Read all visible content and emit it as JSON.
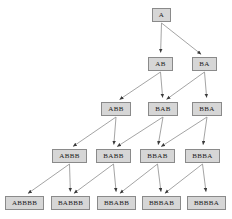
{
  "figure": {
    "type": "directed-graph",
    "title": "",
    "background_color": "#ffffff",
    "node_fill_color": "#d6d6d6",
    "node_border_color": "#8a8a8a",
    "node_text_color": "#1a1a1a",
    "edge_color": "#9a9a9a",
    "arrowhead_color": "#3a3a3a"
  },
  "levels": [
    {
      "index": 0,
      "nodes": [
        "A"
      ]
    },
    {
      "index": 1,
      "nodes": [
        "AB",
        "BA"
      ]
    },
    {
      "index": 2,
      "nodes": [
        "ABB",
        "BAB",
        "BBA"
      ]
    },
    {
      "index": 3,
      "nodes": [
        "ABBB",
        "BABB",
        "BBAB",
        "BBBA"
      ]
    },
    {
      "index": 4,
      "nodes": [
        "ABBBB",
        "BABBB",
        "BBABB",
        "BBBAB",
        "BBBBA"
      ]
    }
  ],
  "nodes": [
    {
      "id": "n0_0",
      "label": "A",
      "x": 152,
      "y": 8,
      "w": 19,
      "h": 14
    },
    {
      "id": "n1_0",
      "label": "AB",
      "x": 148,
      "y": 57,
      "w": 25,
      "h": 14
    },
    {
      "id": "n1_1",
      "label": "BA",
      "x": 192,
      "y": 57,
      "w": 25,
      "h": 14
    },
    {
      "id": "n2_0",
      "label": "ABB",
      "x": 101,
      "y": 102,
      "w": 30,
      "h": 14
    },
    {
      "id": "n2_1",
      "label": "BAB",
      "x": 148,
      "y": 102,
      "w": 30,
      "h": 14
    },
    {
      "id": "n2_2",
      "label": "BBA",
      "x": 192,
      "y": 102,
      "w": 30,
      "h": 14
    },
    {
      "id": "n3_0",
      "label": "ABBB",
      "x": 52,
      "y": 149,
      "w": 35,
      "h": 14
    },
    {
      "id": "n3_1",
      "label": "BABB",
      "x": 96,
      "y": 149,
      "w": 35,
      "h": 14
    },
    {
      "id": "n3_2",
      "label": "BBAB",
      "x": 140,
      "y": 149,
      "w": 35,
      "h": 14
    },
    {
      "id": "n3_3",
      "label": "BBBA",
      "x": 185,
      "y": 149,
      "w": 35,
      "h": 14
    },
    {
      "id": "n4_0",
      "label": "ABBBB",
      "x": 5,
      "y": 196,
      "w": 39,
      "h": 14
    },
    {
      "id": "n4_1",
      "label": "BABBB",
      "x": 51,
      "y": 196,
      "w": 39,
      "h": 14
    },
    {
      "id": "n4_2",
      "label": "BBABB",
      "x": 97,
      "y": 196,
      "w": 39,
      "h": 14
    },
    {
      "id": "n4_3",
      "label": "BBBAB",
      "x": 142,
      "y": 196,
      "w": 39,
      "h": 14
    },
    {
      "id": "n4_4",
      "label": "BBBBA",
      "x": 187,
      "y": 196,
      "w": 39,
      "h": 14
    }
  ],
  "edges": [
    {
      "from": "n0_0",
      "to": "n1_0",
      "kind": "vertical"
    },
    {
      "from": "n0_0",
      "to": "n1_1",
      "kind": "diagonal"
    },
    {
      "from": "n1_0",
      "to": "n2_0",
      "kind": "diagonal"
    },
    {
      "from": "n1_0",
      "to": "n2_1",
      "kind": "vertical"
    },
    {
      "from": "n1_1",
      "to": "n2_1",
      "kind": "diagonal"
    },
    {
      "from": "n1_1",
      "to": "n2_2",
      "kind": "vertical"
    },
    {
      "from": "n2_0",
      "to": "n3_0",
      "kind": "diagonal"
    },
    {
      "from": "n2_0",
      "to": "n3_1",
      "kind": "vertical"
    },
    {
      "from": "n2_1",
      "to": "n3_1",
      "kind": "diagonal"
    },
    {
      "from": "n2_1",
      "to": "n3_2",
      "kind": "vertical"
    },
    {
      "from": "n2_2",
      "to": "n3_2",
      "kind": "diagonal"
    },
    {
      "from": "n2_2",
      "to": "n3_3",
      "kind": "vertical"
    },
    {
      "from": "n3_0",
      "to": "n4_0",
      "kind": "diagonal"
    },
    {
      "from": "n3_0",
      "to": "n4_1",
      "kind": "vertical"
    },
    {
      "from": "n3_1",
      "to": "n4_1",
      "kind": "diagonal"
    },
    {
      "from": "n3_1",
      "to": "n4_2",
      "kind": "vertical"
    },
    {
      "from": "n3_2",
      "to": "n4_2",
      "kind": "diagonal"
    },
    {
      "from": "n3_2",
      "to": "n4_3",
      "kind": "vertical"
    },
    {
      "from": "n3_3",
      "to": "n4_3",
      "kind": "diagonal"
    },
    {
      "from": "n3_3",
      "to": "n4_4",
      "kind": "vertical"
    }
  ]
}
